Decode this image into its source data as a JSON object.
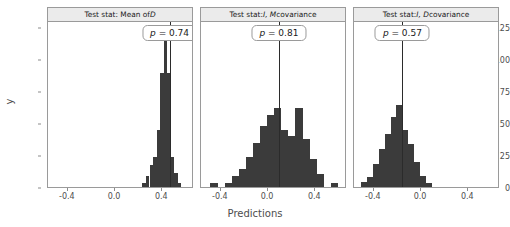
{
  "axes": {
    "ylabel": "y",
    "xlabel": "Predictions",
    "yticks": [
      0,
      25,
      50,
      75,
      100,
      125
    ],
    "ylim": [
      0,
      130
    ],
    "xticks": [
      -0.4,
      0.0,
      0.4
    ],
    "xticklabels": [
      "-0.4",
      "0.0",
      "0.4"
    ],
    "xlim": [
      -0.56,
      0.66
    ]
  },
  "style": {
    "bar_color": "#3b3b3b",
    "strip_fill": "#ebebeb",
    "border_color": "#9a9a9a",
    "line_color": "#2b2b2b",
    "text_color": "#4d4d4d"
  },
  "chart_data": {
    "type": "bar",
    "title": "",
    "xlabel": "Predictions",
    "ylabel": "y",
    "ylim": [
      0,
      130
    ],
    "xlim": [
      -0.56,
      0.66
    ],
    "grid": false,
    "legend": null,
    "panels": [
      {
        "strip_prefix": "Test stat: Mean of ",
        "strip_italic": "D",
        "strip_suffix": "",
        "p_prefix": "p",
        "p_text": " = 0.74",
        "p_value": 0.74,
        "observed_stat": 0.47,
        "bin_width": 0.03,
        "bin_centers": [
          0.255,
          0.285,
          0.315,
          0.345,
          0.375,
          0.405,
          0.435,
          0.465,
          0.495,
          0.525,
          0.555
        ],
        "counts": [
          3,
          9,
          17,
          24,
          45,
          90,
          118,
          90,
          24,
          11,
          3
        ]
      },
      {
        "strip_prefix": "Test stat: ",
        "strip_italic": "I, M",
        "strip_suffix": " covariance",
        "p_prefix": "p",
        "p_text": " = 0.81",
        "p_value": 0.81,
        "observed_stat": 0.1,
        "bin_width": 0.06,
        "bin_centers": [
          -0.45,
          -0.33,
          -0.27,
          -0.21,
          -0.15,
          -0.09,
          -0.03,
          0.03,
          0.09,
          0.15,
          0.21,
          0.27,
          0.33,
          0.39,
          0.45,
          0.57
        ],
        "counts": [
          3,
          3,
          9,
          14,
          24,
          35,
          48,
          57,
          62,
          45,
          40,
          62,
          38,
          22,
          10,
          3
        ]
      },
      {
        "strip_prefix": "Test stat: ",
        "strip_italic": "I, D",
        "strip_suffix": " covariance",
        "p_prefix": "p",
        "p_text": " = 0.57",
        "p_value": 0.57,
        "observed_stat": -0.15,
        "bin_width": 0.05,
        "bin_centers": [
          -0.475,
          -0.425,
          -0.375,
          -0.325,
          -0.275,
          -0.225,
          -0.175,
          -0.125,
          -0.075,
          -0.025,
          0.025,
          0.075
        ],
        "counts": [
          4,
          8,
          18,
          30,
          42,
          55,
          65,
          45,
          34,
          20,
          9,
          3
        ]
      }
    ]
  }
}
